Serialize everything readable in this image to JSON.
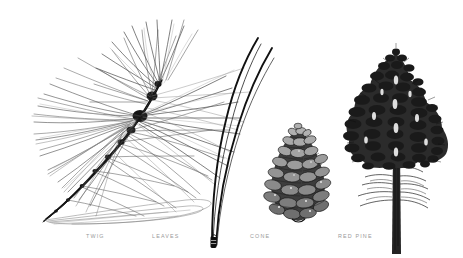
{
  "plate": {
    "kind": "botanical-illustration",
    "medium": "pen-and-ink line drawing",
    "subject": "Red Pine",
    "background_color": "#ffffff",
    "ink_color": "#1a1a1a",
    "caption_color": "#9a9a9a",
    "width": 463,
    "height": 258
  },
  "specimens": [
    {
      "id": "twig",
      "caption": "TWIG",
      "description": "pine branch tip bearing dense long needles radiating from a diagonal stem"
    },
    {
      "id": "leaves",
      "caption": "LEAVES",
      "description": "pair of long slender needles joined at a basal sheath"
    },
    {
      "id": "cone",
      "caption": "CONE",
      "description": "egg-shaped seed cone with overlapping woody scales"
    },
    {
      "id": "tree",
      "caption": "RED PINE",
      "description": "mature conical pine tree with straight trunk and tufted crown"
    }
  ],
  "icons": {
    "twig": "pine-twig-icon",
    "leaves": "pine-needles-icon",
    "cone": "pine-cone-icon",
    "tree": "pine-tree-icon"
  }
}
